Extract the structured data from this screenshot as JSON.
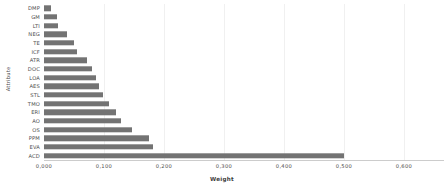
{
  "chart_data": {
    "type": "bar",
    "orientation": "horizontal",
    "title": "",
    "xlabel": "Weight",
    "ylabel": "Attribute",
    "xlim": [
      0.0,
      0.6
    ],
    "ylim": null,
    "grid": true,
    "legend": false,
    "bar_color": "#737373",
    "decimal_separator": ",",
    "xticks": [
      "0,000",
      "0,100",
      "0,200",
      "0,300",
      "0,400",
      "0,500",
      "0,600"
    ],
    "xtick_values": [
      0.0,
      0.1,
      0.2,
      0.3,
      0.4,
      0.5,
      0.6
    ],
    "categories": [
      "DMP",
      "GM",
      "LTI",
      "NEG",
      "TE",
      "ICF",
      "ATR",
      "DOC",
      "LOA",
      "AES",
      "STL",
      "TMO",
      "ERI",
      "AO",
      "OS",
      "PPM",
      "EVA",
      "ACD"
    ],
    "values": [
      0.012,
      0.022,
      0.024,
      0.038,
      0.05,
      0.055,
      0.072,
      0.08,
      0.086,
      0.092,
      0.098,
      0.108,
      0.12,
      0.128,
      0.146,
      0.175,
      0.181,
      0.5
    ]
  }
}
